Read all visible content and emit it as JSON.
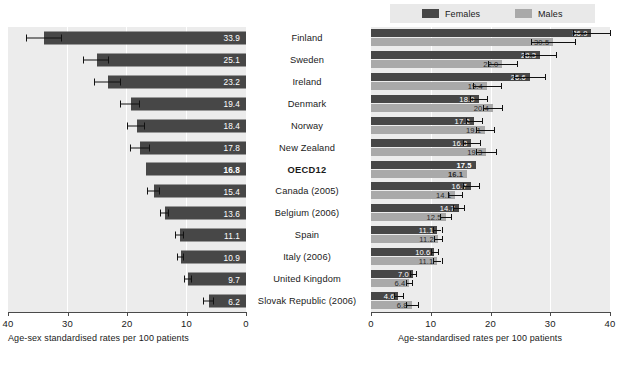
{
  "legend": {
    "females_label": "Females",
    "males_label": "Males",
    "female_color": "#474747",
    "male_color": "#a9a9a9"
  },
  "left_panel": {
    "axis_caption": "Age-sex standardised rates per 100 patients",
    "tick_labels": [
      "40",
      "30",
      "20",
      "10",
      "0"
    ]
  },
  "right_panel": {
    "axis_caption": "Age-standardised rates per 100 patients",
    "tick_labels": [
      "0",
      "10",
      "20",
      "30",
      "40"
    ]
  },
  "countries": [
    "Finland",
    "Sweden",
    "Ireland",
    "Denmark",
    "Norway",
    "New Zealand",
    "OECD12",
    "Canada (2005)",
    "Belgium (2006)",
    "Spain",
    "Italy (2006)",
    "United Kingdom",
    "Slovak Republic (2006)"
  ],
  "chart_data": [
    {
      "type": "bar",
      "title": "",
      "orientation": "horizontal",
      "axis_reversed": true,
      "xlabel": "Age-sex standardised rates per 100 patients",
      "ylabel": "",
      "xlim": [
        0,
        40
      ],
      "xticks": [
        40,
        30,
        20,
        10,
        0
      ],
      "grid": true,
      "legend": "none",
      "categories": [
        "Finland",
        "Sweden",
        "Ireland",
        "Denmark",
        "Norway",
        "New Zealand",
        "OECD12",
        "Canada (2005)",
        "Belgium (2006)",
        "Spain",
        "Italy (2006)",
        "United Kingdom",
        "Slovak Republic (2006)"
      ],
      "values": [
        33.9,
        25.1,
        23.2,
        19.4,
        18.4,
        17.8,
        16.8,
        15.4,
        13.6,
        11.1,
        10.9,
        9.7,
        6.2
      ],
      "error_low": [
        31.0,
        23.0,
        21.0,
        17.8,
        17.0,
        16.2,
        16.8,
        14.4,
        12.9,
        10.5,
        10.4,
        9.1,
        5.3
      ],
      "error_high": [
        36.8,
        27.2,
        25.4,
        21.0,
        19.8,
        19.4,
        16.8,
        16.4,
        14.3,
        11.7,
        11.4,
        10.3,
        7.1
      ],
      "highlight_category": "OECD12"
    },
    {
      "type": "bar",
      "title": "",
      "orientation": "horizontal",
      "axis_reversed": false,
      "xlabel": "Age-standardised rates per 100 patients",
      "ylabel": "",
      "xlim": [
        0,
        40
      ],
      "xticks": [
        0,
        10,
        20,
        30,
        40
      ],
      "grid": true,
      "legend": "top",
      "categories": [
        "Finland",
        "Sweden",
        "Ireland",
        "Denmark",
        "Norway",
        "New Zealand",
        "OECD12",
        "Canada (2005)",
        "Belgium (2006)",
        "Spain",
        "Italy (2006)",
        "United Kingdom",
        "Slovak Republic (2006)"
      ],
      "series": [
        {
          "name": "Females",
          "values": [
            36.9,
            28.3,
            26.6,
            18.0,
            17.2,
            16.8,
            17.5,
            16.7,
            14.7,
            11.1,
            10.6,
            7.0,
            4.6
          ],
          "error_low": [
            33.8,
            25.6,
            24.0,
            16.6,
            15.9,
            15.4,
            17.5,
            15.4,
            13.8,
            10.4,
            10.0,
            6.5,
            3.9
          ],
          "error_high": [
            40.0,
            31.0,
            29.2,
            19.4,
            18.5,
            18.2,
            17.5,
            18.0,
            15.6,
            11.8,
            11.2,
            7.5,
            5.3
          ]
        },
        {
          "name": "Males",
          "values": [
            30.5,
            22.0,
            19.4,
            20.4,
            19.1,
            19.3,
            16.1,
            14.1,
            12.5,
            11.2,
            11.1,
            6.4,
            6.8
          ],
          "error_low": [
            26.8,
            19.6,
            17.0,
            18.8,
            17.6,
            17.6,
            16.1,
            12.9,
            11.6,
            10.5,
            10.4,
            5.9,
            5.8
          ],
          "error_high": [
            34.2,
            24.4,
            21.8,
            22.0,
            20.6,
            21.0,
            16.1,
            15.3,
            13.4,
            11.9,
            11.8,
            6.9,
            7.8
          ]
        }
      ],
      "highlight_category": "OECD12"
    }
  ]
}
